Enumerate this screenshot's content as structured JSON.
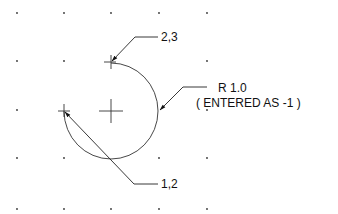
{
  "diagram": {
    "type": "cad-arc-construction",
    "grid": {
      "xs": [
        17,
        64,
        111,
        159,
        207
      ],
      "ys": [
        13,
        61,
        110,
        158,
        209
      ],
      "dot_color": "#333333"
    },
    "arc": {
      "center": [
        111,
        111
      ],
      "radius": 48,
      "start_point_label": "1,2",
      "end_point_label": "2,3",
      "stroke": "#333333"
    },
    "labels": {
      "end_point": "2,3",
      "start_point": "1,2",
      "radius": "R 1.0",
      "radius_note": "( ENTERED AS -1 )"
    }
  }
}
